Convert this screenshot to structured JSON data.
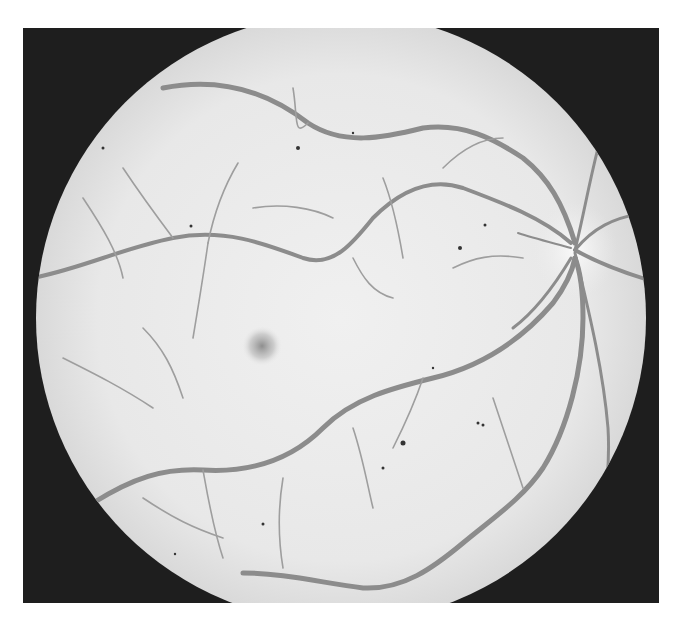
{
  "image": {
    "kind": "grayscale retinal fundus photograph",
    "frame": {
      "x": 23,
      "y": 28,
      "width": 636,
      "height": 575,
      "color": "#1e1e1e"
    },
    "fundus_disc": {
      "cx": 318,
      "cy": 290,
      "r": 305,
      "color": "#e9e9e9"
    },
    "fovea": {
      "cx": 239,
      "cy": 318,
      "r": 18,
      "color": "#9a9a9a"
    },
    "optic_disc": {
      "cx": 552,
      "cy": 222,
      "r": 30,
      "color": "#f7f7f7"
    },
    "vessel_color": "#8c8c8c",
    "spot_color": "#333333"
  }
}
